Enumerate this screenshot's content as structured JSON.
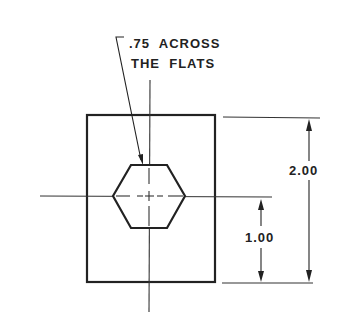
{
  "drawing": {
    "type": "engineering-drawing",
    "callout": {
      "line1": ".75  ACROSS",
      "line2": "THE  FLATS"
    },
    "dimensions": {
      "overall_height": "2.00",
      "center_height": "1.00"
    },
    "colors": {
      "ink": "#222222",
      "paper": "#ffffff"
    }
  }
}
